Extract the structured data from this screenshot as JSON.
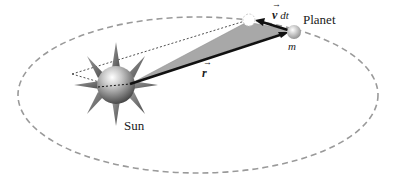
{
  "diagram": {
    "labels": {
      "sun": "Sun",
      "planet": "Planet",
      "mass": "m",
      "radius_vector": "r",
      "velocity_dt": "v dt",
      "velocity_symbol": "v",
      "dt": "dt"
    },
    "colors": {
      "orbit": "#9a9a9a",
      "swept_area": "#a8a8a8",
      "vector": "#111111",
      "sun_body": "#8a8a8a",
      "sun_rays": "#6e6e6e",
      "planet": "#bdbdbd"
    },
    "geometry": {
      "orbit": {
        "cx": 198,
        "cy": 95,
        "rx": 180,
        "ry": 78
      },
      "sun": {
        "cx": 116,
        "cy": 83,
        "r": 18
      },
      "planet": {
        "cx": 294,
        "cy": 32,
        "r": 7
      },
      "ghost_planet": {
        "cx": 249,
        "cy": 20,
        "r": 6
      }
    }
  }
}
